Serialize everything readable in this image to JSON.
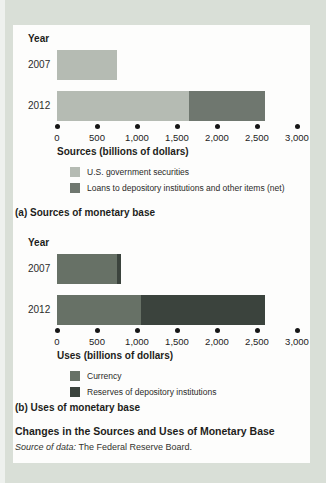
{
  "figure": {
    "title": "Changes in the Sources and Uses of Monetary Base",
    "source_prefix": "Source of data:",
    "source_text": " The Federal Reserve Board."
  },
  "colors": {
    "outer_bg": "#d9dfd7",
    "panel_bg": "#fdfdfc",
    "securities": "#b5bbb3",
    "loans": "#6f776f",
    "currency": "#677166",
    "reserves": "#3b433d",
    "axis_dot": "#161616"
  },
  "chart_data": [
    {
      "type": "bar",
      "orientation": "horizontal",
      "caption": "(a) Sources of monetary base",
      "y_axis_title": "Year",
      "x_axis_title": "Sources (billions of dollars)",
      "categories": [
        "2007",
        "2012"
      ],
      "series": [
        {
          "name": "U.S. government securities",
          "color_key": "securities",
          "values": [
            750,
            1650
          ]
        },
        {
          "name": "Loans to depository institutions and other items (net)",
          "color_key": "loans",
          "values": [
            0,
            950
          ]
        }
      ],
      "xlim": [
        0,
        3000
      ],
      "xticks": [
        0,
        500,
        1000,
        1500,
        2000,
        2500,
        3000
      ],
      "xtick_labels": [
        "0",
        "500",
        "1,000",
        "1,500",
        "2,000",
        "2,500",
        "3,000"
      ],
      "grid": false,
      "legend_position": "below-axis"
    },
    {
      "type": "bar",
      "orientation": "horizontal",
      "caption": "(b) Uses of monetary base",
      "y_axis_title": "Year",
      "x_axis_title": "Uses (billions of dollars)",
      "categories": [
        "2007",
        "2012"
      ],
      "series": [
        {
          "name": "Currency",
          "color_key": "currency",
          "values": [
            750,
            1050
          ]
        },
        {
          "name": "Reserves of depository institutions",
          "color_key": "reserves",
          "values": [
            50,
            1550
          ]
        }
      ],
      "xlim": [
        0,
        3000
      ],
      "xticks": [
        0,
        500,
        1000,
        1500,
        2000,
        2500,
        3000
      ],
      "xtick_labels": [
        "0",
        "500",
        "1,000",
        "1,500",
        "2,000",
        "2,500",
        "3,000"
      ],
      "grid": false,
      "legend_position": "below-axis"
    }
  ]
}
